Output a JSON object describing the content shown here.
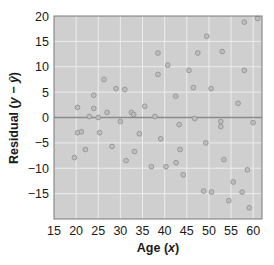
{
  "chart_data": {
    "type": "scatter",
    "title": "",
    "xlabel": "Age (x)",
    "ylabel": "Residual (y − ŷ)",
    "xlim": [
      15,
      62
    ],
    "ylim": [
      -20,
      20
    ],
    "xticks": [
      15,
      20,
      25,
      30,
      35,
      40,
      45,
      50,
      55,
      60
    ],
    "yticks": [
      20,
      15,
      10,
      5,
      0,
      -5,
      -10,
      -15
    ],
    "ytick_labels": [
      "20",
      "15",
      "10",
      "5",
      "0",
      "−5",
      "−10",
      "−15"
    ],
    "grid": true,
    "reference_line": 0,
    "legend": null,
    "colors": {
      "plot_background": "#cfcfcf",
      "grid": "#ececec",
      "zero_line": "#8a8a8a",
      "point_fill": "#bdbdbd",
      "point_stroke": "#8e8e8e",
      "frame": "#7a7a7a"
    },
    "points": [
      {
        "x": 20.3,
        "y": 2.0
      },
      {
        "x": 24.0,
        "y": 4.4
      },
      {
        "x": 24.0,
        "y": 1.8
      },
      {
        "x": 26.3,
        "y": 7.5
      },
      {
        "x": 29.0,
        "y": 5.7
      },
      {
        "x": 31.0,
        "y": 5.5
      },
      {
        "x": 27.0,
        "y": 1.0
      },
      {
        "x": 23.0,
        "y": 0.2
      },
      {
        "x": 25.0,
        "y": 0.0
      },
      {
        "x": 32.5,
        "y": 1.0
      },
      {
        "x": 30.0,
        "y": -0.8
      },
      {
        "x": 33.0,
        "y": 0.6
      },
      {
        "x": 58.0,
        "y": 18.8
      },
      {
        "x": 61.0,
        "y": 19.5
      },
      {
        "x": 49.5,
        "y": 16.0
      },
      {
        "x": 38.5,
        "y": 12.7
      },
      {
        "x": 47.5,
        "y": 12.7
      },
      {
        "x": 53.0,
        "y": 13.0
      },
      {
        "x": 40.7,
        "y": 10.3
      },
      {
        "x": 45.5,
        "y": 9.3
      },
      {
        "x": 38.5,
        "y": 8.5
      },
      {
        "x": 58.0,
        "y": 9.3
      },
      {
        "x": 46.5,
        "y": 5.9
      },
      {
        "x": 50.5,
        "y": 5.7
      },
      {
        "x": 42.5,
        "y": 4.2
      },
      {
        "x": 56.6,
        "y": 2.8
      },
      {
        "x": 35.5,
        "y": 2.2
      },
      {
        "x": 37.8,
        "y": 0.2
      },
      {
        "x": 46.8,
        "y": -0.2
      },
      {
        "x": 43.3,
        "y": -1.4
      },
      {
        "x": 52.7,
        "y": -0.8
      },
      {
        "x": 52.7,
        "y": -1.8
      },
      {
        "x": 60.0,
        "y": -1.0
      },
      {
        "x": 20.3,
        "y": -3.0
      },
      {
        "x": 21.2,
        "y": -2.8
      },
      {
        "x": 25.3,
        "y": -3.0
      },
      {
        "x": 22.1,
        "y": -6.3
      },
      {
        "x": 28.1,
        "y": -5.7
      },
      {
        "x": 19.6,
        "y": -7.9
      },
      {
        "x": 33.2,
        "y": -6.7
      },
      {
        "x": 31.3,
        "y": -8.5
      },
      {
        "x": 34.3,
        "y": -3.2
      },
      {
        "x": 39.1,
        "y": -4.2
      },
      {
        "x": 49.3,
        "y": -5.0
      },
      {
        "x": 43.5,
        "y": -6.3
      },
      {
        "x": 42.6,
        "y": -8.9
      },
      {
        "x": 37.0,
        "y": -9.7
      },
      {
        "x": 40.3,
        "y": -9.7
      },
      {
        "x": 44.2,
        "y": -11.3
      },
      {
        "x": 53.4,
        "y": -8.3
      },
      {
        "x": 58.7,
        "y": -10.3
      },
      {
        "x": 55.5,
        "y": -12.7
      },
      {
        "x": 57.5,
        "y": -14.7
      },
      {
        "x": 48.8,
        "y": -14.5
      },
      {
        "x": 50.6,
        "y": -14.7
      },
      {
        "x": 54.5,
        "y": -16.4
      },
      {
        "x": 59.1,
        "y": -17.8
      }
    ]
  }
}
